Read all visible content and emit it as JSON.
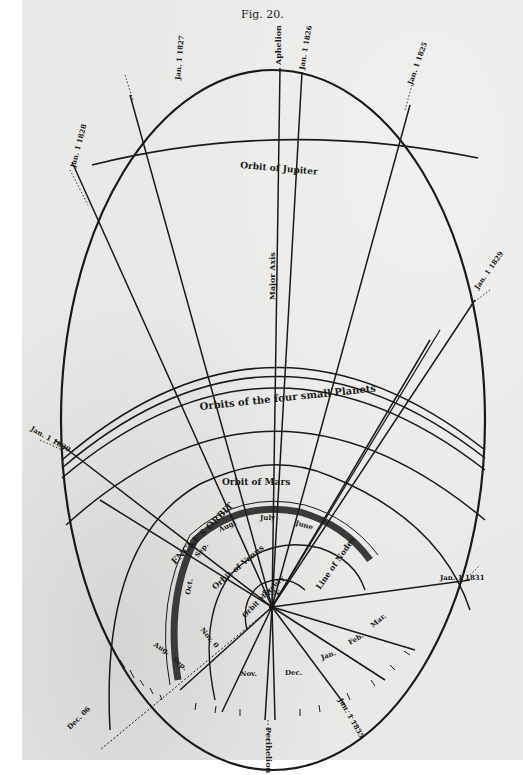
{
  "figure": {
    "title": "Fig. 20.",
    "colors": {
      "paper": "#e9e9e7",
      "ink": "#1a1a1a",
      "comet_band": "#3a3a3a"
    }
  },
  "orbits": {
    "jupiter": "Orbit of Jupiter",
    "small_planets": "Orbits of the four small Planets",
    "mars": "Orbit of Mars",
    "encke": "ENCKE'S ORBIT",
    "venus": "Orbit of Venus",
    "mercury": "Orbit Mercury",
    "sun": "SUN"
  },
  "axes": {
    "major_axis": "Major Axis",
    "line_of_nodes": "Line of Nodes",
    "aphelion": "Aphelion",
    "perihelion": "Perihelion"
  },
  "date_markers": {
    "jan1_1827": "Jan. 1 1827",
    "jan1_1826": "Jan. 1 1826",
    "jan1_1825_top": "Jan. 1 1825",
    "jan1_1828": "Jan. 1 1828",
    "jan1_1829": "Jan. 1 1829",
    "jan1_1830": "Jan. 1 1830",
    "jan1_1831": "Jan. 1 1831",
    "jan1_1835": "Jan. 1 1835",
    "dec": "Dec. 06"
  },
  "months_inner": {
    "july": "July",
    "june": "June",
    "aug": "Augt",
    "sep": "Sep.",
    "oct": "Oct.",
    "nov": "Nov. 0"
  },
  "months_outer": {
    "aug": "Aug.",
    "sep": "Sep.",
    "nov": "Nov.",
    "dec": "Dec.",
    "jan": "Jan.",
    "feb": "Feb.",
    "mar": "Mar."
  }
}
